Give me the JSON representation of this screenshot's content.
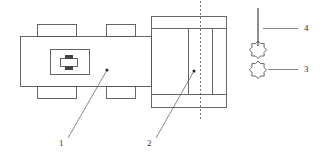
{
  "diagram": {
    "type": "patent-schematic",
    "labels": [
      {
        "id": "1",
        "text": "1"
      },
      {
        "id": "2",
        "text": "2"
      },
      {
        "id": "3",
        "text": "3"
      },
      {
        "id": "4",
        "text": "4"
      }
    ],
    "colors": {
      "stroke": "#555555",
      "fill_dark": "#444444",
      "background": "#ffffff"
    }
  }
}
